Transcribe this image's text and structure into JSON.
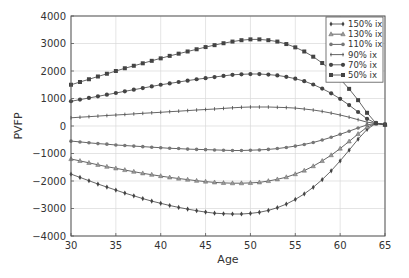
{
  "chart_data": {
    "type": "line",
    "title": "",
    "xlabel": "Age",
    "ylabel": "PVFP",
    "xlim": [
      30,
      65
    ],
    "ylim": [
      -4000,
      4000
    ],
    "xticks": [
      30,
      35,
      40,
      45,
      50,
      55,
      60,
      65
    ],
    "yticks": [
      -4000,
      -3000,
      -2000,
      -1000,
      0,
      1000,
      2000,
      3000,
      4000
    ],
    "grid": true,
    "legend_position": "upper right",
    "x": [
      30,
      31,
      32,
      33,
      34,
      35,
      36,
      37,
      38,
      39,
      40,
      41,
      42,
      43,
      44,
      45,
      46,
      47,
      48,
      49,
      50,
      51,
      52,
      53,
      54,
      55,
      56,
      57,
      58,
      59,
      60,
      61,
      62,
      63,
      64,
      65
    ],
    "series": [
      {
        "name": "150% ix",
        "marker": "diamond",
        "values": [
          -1750,
          -1870,
          -1990,
          -2110,
          -2220,
          -2330,
          -2440,
          -2540,
          -2640,
          -2730,
          -2810,
          -2890,
          -2960,
          -3020,
          -3080,
          -3130,
          -3170,
          -3190,
          -3200,
          -3200,
          -3180,
          -3140,
          -3070,
          -2970,
          -2840,
          -2670,
          -2470,
          -2230,
          -1950,
          -1630,
          -1270,
          -880,
          -480,
          -120,
          100,
          50
        ]
      },
      {
        "name": "130% ix",
        "marker": "triangle",
        "values": [
          -1200,
          -1270,
          -1340,
          -1410,
          -1480,
          -1540,
          -1600,
          -1660,
          -1720,
          -1770,
          -1820,
          -1870,
          -1910,
          -1950,
          -1990,
          -2020,
          -2050,
          -2070,
          -2080,
          -2080,
          -2070,
          -2050,
          -2000,
          -1940,
          -1860,
          -1750,
          -1620,
          -1460,
          -1270,
          -1060,
          -820,
          -560,
          -290,
          -40,
          100,
          50
        ]
      },
      {
        "name": "110% ix",
        "marker": "hexagon",
        "values": [
          -550,
          -580,
          -610,
          -640,
          -660,
          -690,
          -710,
          -730,
          -750,
          -770,
          -790,
          -810,
          -820,
          -840,
          -850,
          -860,
          -870,
          -880,
          -890,
          -890,
          -880,
          -870,
          -850,
          -820,
          -780,
          -730,
          -670,
          -600,
          -510,
          -410,
          -300,
          -190,
          -70,
          40,
          100,
          50
        ]
      },
      {
        "name": "90% ix",
        "marker": "tick",
        "values": [
          300,
          320,
          340,
          360,
          380,
          400,
          420,
          440,
          460,
          480,
          500,
          520,
          540,
          560,
          580,
          600,
          620,
          640,
          660,
          680,
          690,
          690,
          690,
          680,
          670,
          650,
          620,
          580,
          530,
          470,
          400,
          320,
          230,
          140,
          100,
          50
        ]
      },
      {
        "name": "70% ix",
        "marker": "circle",
        "values": [
          900,
          960,
          1020,
          1080,
          1140,
          1200,
          1260,
          1320,
          1380,
          1440,
          1500,
          1550,
          1600,
          1650,
          1700,
          1740,
          1780,
          1820,
          1860,
          1880,
          1890,
          1890,
          1870,
          1840,
          1790,
          1720,
          1630,
          1510,
          1360,
          1190,
          990,
          760,
          510,
          260,
          100,
          50
        ]
      },
      {
        "name": "50% ix",
        "marker": "square",
        "values": [
          1500,
          1600,
          1700,
          1800,
          1900,
          2000,
          2100,
          2190,
          2280,
          2370,
          2460,
          2550,
          2630,
          2710,
          2790,
          2870,
          2940,
          3010,
          3070,
          3120,
          3150,
          3150,
          3120,
          3070,
          2980,
          2860,
          2710,
          2520,
          2290,
          2020,
          1710,
          1350,
          940,
          480,
          100,
          50
        ]
      }
    ]
  },
  "axes": {
    "xlabel": "Age",
    "ylabel": "PVFP",
    "xtick_labels": [
      "30",
      "35",
      "40",
      "45",
      "50",
      "55",
      "60",
      "65"
    ],
    "ytick_labels": [
      "−4000",
      "−3000",
      "−2000",
      "−1000",
      "0",
      "1000",
      "2000",
      "3000",
      "4000"
    ]
  },
  "legend": {
    "items": [
      "150% ix",
      "130% ix",
      "110% ix",
      "90% ix",
      "70% ix",
      "50% ix"
    ]
  },
  "colors": {
    "line": "#555555",
    "marker": "#444444",
    "grid": "#d9d9d9",
    "axis": "#555555"
  }
}
